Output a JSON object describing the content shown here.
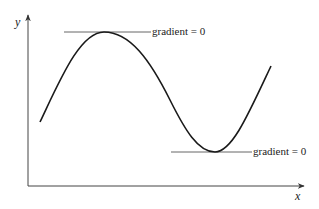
{
  "diagram": {
    "title": "",
    "axes": {
      "x_label": "x",
      "y_label": "y",
      "color": "#444444"
    },
    "curve": {
      "description": "sinusoidal curve with one maximum and one minimum",
      "color": "#1a1a1a"
    },
    "annotations": [
      {
        "id": "maximum",
        "text": "gradient = 0",
        "tangent_color": "#555555"
      },
      {
        "id": "minimum",
        "text": "gradient = 0",
        "tangent_color": "#555555"
      }
    ]
  }
}
